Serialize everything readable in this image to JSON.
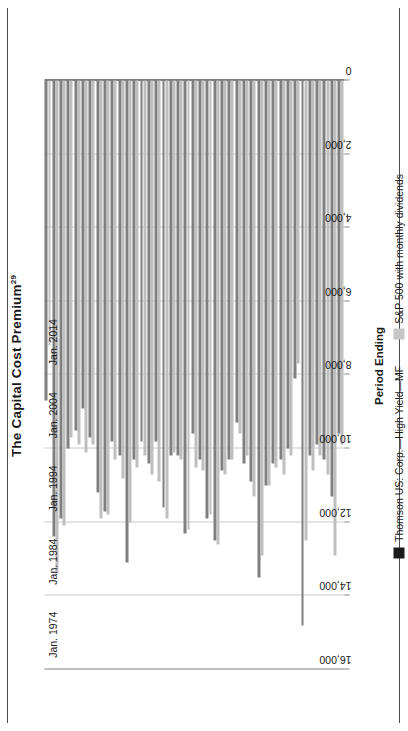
{
  "title": {
    "text": "The Capital Cost Premium",
    "footnote": "29"
  },
  "axis": {
    "x_title": "Period Ending",
    "value_ticks": [
      "16,000",
      "14,000",
      "12,000",
      "10,000",
      "8,000",
      "6,000",
      "4,000",
      "2,000",
      "0"
    ],
    "value_tick_numbers": [
      16000,
      14000,
      12000,
      10000,
      8000,
      6000,
      4000,
      2000,
      0
    ],
    "category_labels": [
      "Jan. 1974",
      "Jan. 1984",
      "Jan. 1994",
      "Jan. 2004",
      "Jan. 2014"
    ]
  },
  "legend": {
    "items": [
      {
        "label": "Thomson US: Corp.—High Yield—MF",
        "color": "#1a1a1a",
        "swatch": "dark"
      },
      {
        "label": "S&P 500 with monthly dividends",
        "color": "#c6c6c6",
        "swatch": "light"
      }
    ]
  },
  "colors": {
    "series_dark": "#7f7f7f",
    "series_light": "#bfbfbf",
    "gridline": "#c9c9c9",
    "axis": "#000000",
    "frame": "#4d4d4d",
    "text": "#1a1a1a"
  },
  "chart_data": {
    "type": "bar",
    "orientation": "horizontal",
    "title": "The Capital Cost Premium",
    "xlabel": "",
    "ylabel": "Period Ending",
    "xlim": [
      0,
      16000
    ],
    "grid": true,
    "legend_position": "bottom",
    "categories": [
      "Jan. 1974",
      "Jan. 1975",
      "Jan. 1976",
      "Jan. 1977",
      "Jan. 1978",
      "Jan. 1979",
      "Jan. 1980",
      "Jan. 1981",
      "Jan. 1982",
      "Jan. 1983",
      "Jan. 1984",
      "Jan. 1985",
      "Jan. 1986",
      "Jan. 1987",
      "Jan. 1988",
      "Jan. 1989",
      "Jan. 1990",
      "Jan. 1991",
      "Jan. 1992",
      "Jan. 1993",
      "Jan. 1994",
      "Jan. 1995",
      "Jan. 1996",
      "Jan. 1997",
      "Jan. 1998",
      "Jan. 1999",
      "Jan. 2000",
      "Jan. 2001",
      "Jan. 2002",
      "Jan. 2003",
      "Jan. 2004",
      "Jan. 2005",
      "Jan. 2006",
      "Jan. 2007",
      "Jan. 2008",
      "Jan. 2009",
      "Jan. 2010",
      "Jan. 2011",
      "Jan. 2012",
      "Jan. 2013",
      "Jan. 2014"
    ],
    "series": [
      {
        "name": "Thomson US: Corp.—High Yield—MF",
        "color": "#7f7f7f",
        "values": [
          8700,
          12400,
          11900,
          10000,
          9500,
          8900,
          9700,
          11200,
          11700,
          9800,
          10200,
          13100,
          10300,
          9800,
          10400,
          9800,
          11600,
          10200,
          10200,
          12300,
          9600,
          10300,
          11900,
          12500,
          10600,
          10300,
          9300,
          10400,
          10900,
          13500,
          11000,
          10400,
          10300,
          10000,
          8100,
          14800,
          10200,
          9900,
          10300,
          11300,
          9600
        ]
      },
      {
        "name": "S&P 500 with monthly dividends",
        "color": "#bfbfbf",
        "values": [
          7200,
          13400,
          12100,
          9700,
          9900,
          10100,
          9900,
          11900,
          11800,
          10300,
          10800,
          12000,
          10500,
          10200,
          10700,
          10900,
          11900,
          10100,
          10300,
          12200,
          10500,
          10600,
          11800,
          12600,
          10700,
          10300,
          9600,
          10200,
          11300,
          12900,
          11000,
          10500,
          10700,
          10200,
          7700,
          12500,
          10600,
          10200,
          10700,
          12900,
          9900
        ]
      }
    ]
  }
}
